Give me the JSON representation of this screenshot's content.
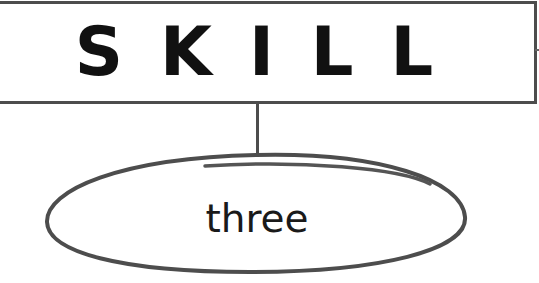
{
  "diagram": {
    "header": {
      "title": "SKILL"
    },
    "node": {
      "label": "three"
    },
    "colors": {
      "stroke": "#4d4d4d",
      "text": "#111111",
      "background": "#ffffff"
    }
  }
}
